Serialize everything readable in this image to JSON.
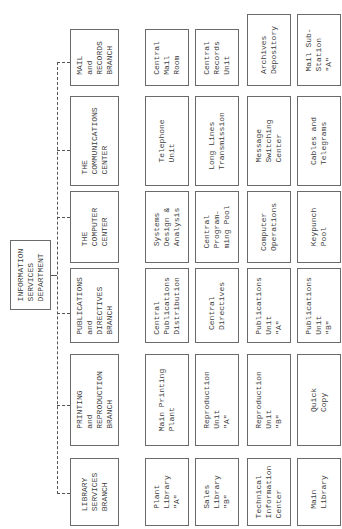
{
  "chart_title": "Information Services Department Organization Chart",
  "orientation": "rotated 90 degrees counter-clockwise",
  "department": {
    "label": "INFORMATION\nSERVICES\nDEPARTMENT"
  },
  "branches": [
    {
      "label": "MAIL\nand\nRECORDS\nBRANCH",
      "units": [
        "Central\nMail\nRoom",
        "Central\nRecords\nUnit",
        "Archives\nDepository",
        "Mail Sub-\nStation\n\"A\""
      ]
    },
    {
      "label": "THE\nCOMMUNICATIONS\nCENTER",
      "units": [
        "Telephone\nUnit",
        "Long Lines\nTransmission",
        "Message\nSwitching\nCenter",
        "Cables and\nTelegrams"
      ]
    },
    {
      "label": "THE\nCOMPUTER\nCENTER",
      "units": [
        "Systems\nDesign &\nAnalysis",
        "Central\nProgram-\nming Pool",
        "Computer\nOperations",
        "Keypunch\nPool"
      ]
    },
    {
      "label": "PUBLICATIONS\nand\nDIRECTIVES\nBRANCH",
      "units": [
        "Central\nPublications\nDistribution",
        "Central\nDirectives",
        "Publications\nUnit\n\"A\"",
        "Publications\nUnit\n\"B\""
      ]
    },
    {
      "label": "PRINTING\nand\nREPRODUCTION\nBRANCH",
      "units": [
        "Main Printing\nPlant",
        "Reproduction\nUnit\n\"A\"",
        "Reproduction\nUnit\n\"B\"",
        "Quick\nCopy"
      ]
    },
    {
      "label": "LIBRARY\nSERVICES\nBRANCH",
      "units": [
        "Plant\nLibrary\n\"A\"",
        "Sales\nLibrary\n\"B\"",
        "Technical\nInformation\nCenter",
        "Main\nLibrary"
      ]
    }
  ],
  "colors": {
    "line": "#555555",
    "border": "#6a6a6a",
    "text": "#3a3a3a",
    "background": "#ffffff"
  }
}
